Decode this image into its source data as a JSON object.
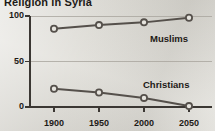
{
  "chart_data": {
    "type": "line",
    "title": "Religion in Syria",
    "xlabel": "",
    "ylabel": "",
    "x": [
      1900,
      1950,
      2000,
      2050
    ],
    "categories": [
      "1900",
      "1950",
      "2000",
      "2050"
    ],
    "series": [
      {
        "name": "Muslims",
        "values": [
          86,
          90,
          93,
          98
        ]
      },
      {
        "name": "Christians",
        "values": [
          20,
          16,
          10,
          1
        ]
      }
    ],
    "ylim": [
      0,
      100
    ],
    "yticks": [
      0,
      50,
      100
    ],
    "ytick_labels": [
      "0",
      "50",
      "100"
    ],
    "xtick_labels": [
      "1900",
      "1950",
      "2000",
      "2050"
    ],
    "grid": true,
    "legend_position": "inline-annotations",
    "colors": {
      "line": "#55504b",
      "marker_fill": "#e6e4de",
      "axis": "#3b3733",
      "grid": "#a9a59e",
      "background": "#d9d7d0",
      "text": "#1d1a17"
    }
  }
}
